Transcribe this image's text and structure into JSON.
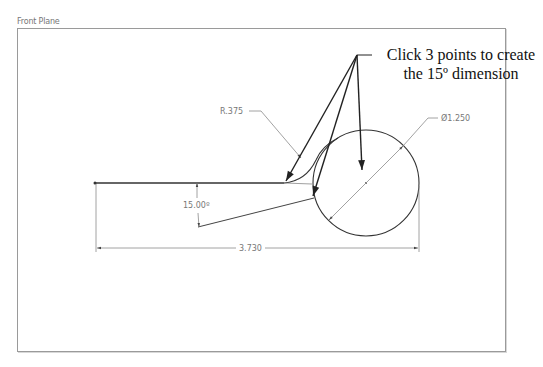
{
  "view": {
    "plane_label": "Front Plane"
  },
  "callout": {
    "line1": "Click 3 points to create",
    "line2": "the 15º dimension"
  },
  "dimensions": {
    "fillet_radius": "R.375",
    "circle_diameter": "Ø1.250",
    "angle": "15.00º",
    "length": "3.730"
  },
  "colors": {
    "geometry": "#333333",
    "dimension": "#8a8a8a",
    "callout_arrow": "#222222",
    "frame": "#9a9a9a"
  }
}
